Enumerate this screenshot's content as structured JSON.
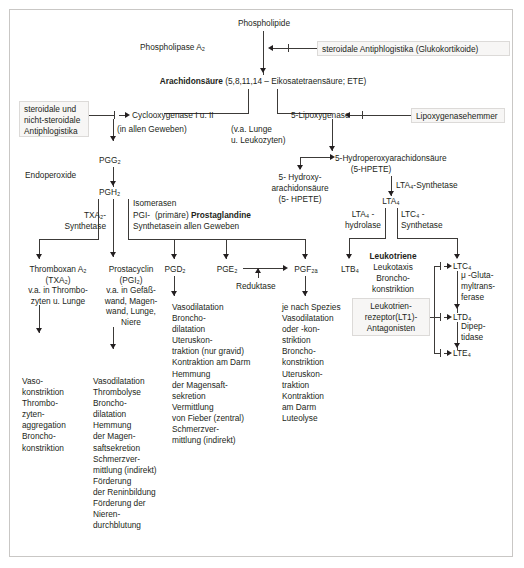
{
  "diagram": {
    "top": {
      "phospholipide": "Phospholipide",
      "phospholipase": "Phospholipase A₂",
      "steroidale_antiphlogistika": "steroidale Antiphlogistika (Glukokortikoide)",
      "arachidonsaeure_bold": "Arachidonsäure",
      "arachidonsaeure_rest": " (5,8,11,14 – Eikosatetraensäure; ETE)"
    },
    "enzymes": {
      "cox_inhibitor_box": "steroidale und\nnicht-steroidale\nAntiphlogistika",
      "cyclooxygenase": "Cyclooxygenase I u. II",
      "cyclooxygenase_note": "(in allen Geweben)",
      "lipoxygenase": "5-Lipoxygenase",
      "lipoxygenase_note": "(v.a. Lunge\nu. Leukozyten)",
      "lipoxygenase_inhibitor": "Lipoxygenasehemmer"
    },
    "cox_branch": {
      "endoperoxide": "Endoperoxide",
      "pgg2": "PGG₂",
      "pgh2": "PGH₂",
      "isomerasen": "Isomerasen",
      "txa2_synthetase": "TXA₂-\nSynthetase",
      "pgi_synthetase": "PGI-\nSynthetase",
      "prostaglandine_prefix": "(primäre) ",
      "prostaglandine_bold": "Prostaglandine",
      "prostaglandine_note": "in allen Geweben",
      "thromboxan": "Thromboxan A₂\n(TXA₂)\nv.a. in Thrombo-\nzyten u. Lunge",
      "prostacyclin": "Prostacyclin\n(PGI₂)\nv.a. in Gefäß-\nwand, Magen-\nwand, Lunge,\nNiere",
      "pgd2": "PGD₂",
      "pge2": "PGE₂",
      "pgf2a": "PGF₂ₐ",
      "reduktase": "Reduktase",
      "txa2_effects": "Vaso-\nkonstriktion\nThrombo-\nzyten-\naggregation\nBroncho-\nkonstriktion",
      "pgi2_effects": "Vasodilatation\nThrombolyse\nBroncho-\ndilatation\nHemmung\nder Magen-\nsaftsekretion\nSchmerzver-\nmittlung (indirekt)\nFörderung\nder Reninbildung\nFörderung der Nieren-\ndurchblutung",
      "pgd2_effects": "Vasodilatation\nBroncho-\ndilatation\nUteruskon-\ntraktion (nur gravid)\nKontraktion am Darm\nHemmung\nder Magensaft-\nsekretion\nVermittlung\nvon Fieber (zentral)\nSchmerzver-\nmittlung (indirekt)",
      "pgf2a_effects": "je nach Spezies\nVasodilatation\noder -kon-\nstriktion\nBroncho-\nkonstriktion\nUteruskon-\ntraktion\nKontraktion\nam Darm\nLuteolyse"
    },
    "lox_branch": {
      "hydroperoxy": "5-Hydroperoxyarachidonsäure",
      "hydroperoxy_abbr": "(5-HPETE)",
      "hydroxy": "5- Hydroxy-\narachidonsäure",
      "hydroxy_abbr": "(5- HPETE)",
      "lta4_synthetase": "LTA₄-Synthetase",
      "lta4": "LTA₄",
      "lta4_hydrolase": "LTA₄ -\nhydrolase",
      "ltc4_synthetase": "LTC₄ -\nSynthetase",
      "ltb4": "LTB₄",
      "leukotriene_bold": "Leukotriene",
      "leukotriene_effects": "Leukotaxis\nBroncho-\nkonstriktion",
      "lt1_antagonists": "Leukotrien-\nrezeptor(LT1)-\nAntagonisten",
      "ltc4": "LTC₄",
      "ltd4": "LTD₄",
      "lte4": "LTE₄",
      "glutamyltransferase": "μ -Gluta-\nmyltrans-\nferase",
      "dipeptidase": "Dipep-\ntidase"
    },
    "colors": {
      "ink": "#231f20",
      "line": "#3c3a38",
      "box_fill": "#f7f6f5",
      "box_border": "#dcdad8",
      "frame": "#c9c7c5"
    }
  }
}
